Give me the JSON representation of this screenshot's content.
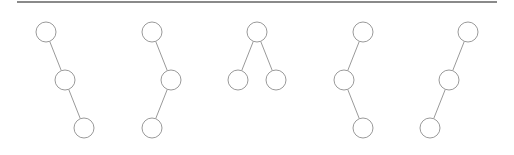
{
  "diagram": {
    "title": "",
    "rule": {
      "x1": 17,
      "x2": 497,
      "y": 2,
      "color": "#8a8a8a",
      "width": 2
    },
    "node_style": {
      "radius": 10,
      "stroke": "#9a9a9a",
      "fill": "#ffffff"
    },
    "edge_style": {
      "stroke": "#9a9a9a",
      "width": 1
    },
    "trees": [
      {
        "name": "tree-1-right-right",
        "nodes": [
          {
            "x": 46,
            "y": 32
          },
          {
            "x": 65,
            "y": 80
          },
          {
            "x": 84,
            "y": 128
          }
        ],
        "edges": [
          [
            0,
            1
          ],
          [
            1,
            2
          ]
        ]
      },
      {
        "name": "tree-2-right-left",
        "nodes": [
          {
            "x": 152,
            "y": 32
          },
          {
            "x": 171,
            "y": 80
          },
          {
            "x": 152,
            "y": 128
          }
        ],
        "edges": [
          [
            0,
            1
          ],
          [
            1,
            2
          ]
        ]
      },
      {
        "name": "tree-3-balanced",
        "nodes": [
          {
            "x": 257,
            "y": 32
          },
          {
            "x": 238,
            "y": 80
          },
          {
            "x": 276,
            "y": 80
          }
        ],
        "edges": [
          [
            0,
            1
          ],
          [
            0,
            2
          ]
        ]
      },
      {
        "name": "tree-4-left-right",
        "nodes": [
          {
            "x": 363,
            "y": 32
          },
          {
            "x": 344,
            "y": 80
          },
          {
            "x": 363,
            "y": 128
          }
        ],
        "edges": [
          [
            0,
            1
          ],
          [
            1,
            2
          ]
        ]
      },
      {
        "name": "tree-5-left-left",
        "nodes": [
          {
            "x": 468,
            "y": 32
          },
          {
            "x": 449,
            "y": 80
          },
          {
            "x": 430,
            "y": 128
          }
        ],
        "edges": [
          [
            0,
            1
          ],
          [
            1,
            2
          ]
        ]
      }
    ]
  }
}
